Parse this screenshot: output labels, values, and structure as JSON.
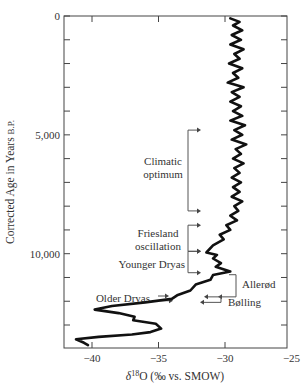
{
  "chart_data": {
    "type": "line",
    "orientation": "vertical-profile",
    "title": "",
    "xlabel": "δ18O (‰ vs. SMOW)",
    "xlabel_parts": {
      "delta": "δ",
      "sup": "18",
      "rest": "O (‰ vs. SMOW)"
    },
    "ylabel": "Corrected Age in Years B.P.",
    "ylabel_parts": {
      "main": "Corrected Age in Years ",
      "small": "B.P."
    },
    "xlim": [
      -42,
      -25
    ],
    "ylim": [
      0,
      14000
    ],
    "y_inverted": true,
    "grid": false,
    "x_ticks": [
      -40,
      -35,
      -30,
      -25
    ],
    "x_tick_labels": [
      "−40",
      "−35",
      "−30",
      "−25"
    ],
    "y_ticks_major": [
      0,
      5000,
      10000
    ],
    "y_tick_labels": [
      "0",
      "5,000",
      "10,000"
    ],
    "y_minor_tick_step": 1000,
    "series": [
      {
        "name": "δ18O profile",
        "points": [
          [
            -29.6,
            100
          ],
          [
            -28.9,
            250
          ],
          [
            -29.4,
            400
          ],
          [
            -28.7,
            600
          ],
          [
            -29.5,
            800
          ],
          [
            -28.8,
            1000
          ],
          [
            -29.6,
            1200
          ],
          [
            -28.6,
            1400
          ],
          [
            -29.3,
            1600
          ],
          [
            -28.9,
            1800
          ],
          [
            -29.7,
            2000
          ],
          [
            -28.7,
            2200
          ],
          [
            -29.4,
            2400
          ],
          [
            -29.0,
            2600
          ],
          [
            -29.8,
            2800
          ],
          [
            -28.6,
            3000
          ],
          [
            -29.5,
            3200
          ],
          [
            -28.9,
            3400
          ],
          [
            -29.6,
            3600
          ],
          [
            -28.8,
            3800
          ],
          [
            -29.4,
            4000
          ],
          [
            -28.7,
            4200
          ],
          [
            -29.6,
            4400
          ],
          [
            -28.5,
            4600
          ],
          [
            -29.3,
            4800
          ],
          [
            -28.7,
            5000
          ],
          [
            -29.5,
            5200
          ],
          [
            -28.4,
            5400
          ],
          [
            -29.2,
            5600
          ],
          [
            -28.8,
            5800
          ],
          [
            -29.4,
            6000
          ],
          [
            -28.6,
            6200
          ],
          [
            -29.3,
            6400
          ],
          [
            -28.9,
            6600
          ],
          [
            -29.5,
            6800
          ],
          [
            -28.8,
            7000
          ],
          [
            -29.4,
            7200
          ],
          [
            -28.9,
            7400
          ],
          [
            -29.5,
            7600
          ],
          [
            -28.7,
            7800
          ],
          [
            -29.3,
            8000
          ],
          [
            -29.0,
            8200
          ],
          [
            -29.6,
            8400
          ],
          [
            -29.1,
            8600
          ],
          [
            -29.9,
            8800
          ],
          [
            -29.6,
            9000
          ],
          [
            -30.4,
            9200
          ],
          [
            -30.1,
            9400
          ],
          [
            -30.9,
            9650
          ],
          [
            -31.4,
            9950
          ],
          [
            -30.6,
            10050
          ],
          [
            -30.9,
            10200
          ],
          [
            -30.3,
            10400
          ],
          [
            -30.7,
            10550
          ],
          [
            -29.6,
            10750
          ],
          [
            -30.9,
            10900
          ],
          [
            -31.1,
            11100
          ],
          [
            -32.2,
            11300
          ],
          [
            -32.6,
            11550
          ],
          [
            -33.6,
            11750
          ],
          [
            -34.0,
            11900
          ],
          [
            -36.0,
            12050
          ],
          [
            -38.5,
            12200
          ],
          [
            -39.8,
            12350
          ],
          [
            -38.0,
            12500
          ],
          [
            -36.8,
            12650
          ],
          [
            -36.9,
            12800
          ],
          [
            -35.2,
            12950
          ],
          [
            -34.8,
            13150
          ],
          [
            -35.6,
            13300
          ],
          [
            -37.0,
            13400
          ],
          [
            -39.5,
            13500
          ],
          [
            -41.2,
            13600
          ],
          [
            -40.6,
            13750
          ],
          [
            -40.3,
            13850
          ]
        ]
      }
    ],
    "annotations": [
      {
        "label": "Climatic optimum",
        "lines": [
          "Climatic",
          "optimum"
        ],
        "bracket_from": 4800,
        "bracket_to": 8200
      },
      {
        "label": "Friesland oscillation",
        "lines": [
          "Friesland",
          "oscillation"
        ],
        "bracket_from": 8800,
        "bracket_to": 9900
      },
      {
        "label": "Younger Dryas",
        "lines": [
          "Younger Dryas"
        ],
        "bracket_from": 9900,
        "bracket_to": 10800
      },
      {
        "label": "Allerød",
        "lines": [
          "Allerød"
        ],
        "bracket_from": 10800,
        "bracket_to": 11900
      },
      {
        "label": "Bølling",
        "lines": [
          "Bølling"
        ],
        "bracket_from": 11900,
        "bracket_to": 12300
      },
      {
        "label": "Older Dryas",
        "lines": [
          "Older Dryas"
        ],
        "bracket_from": 11750,
        "bracket_to": 11950
      }
    ],
    "legend": null
  }
}
